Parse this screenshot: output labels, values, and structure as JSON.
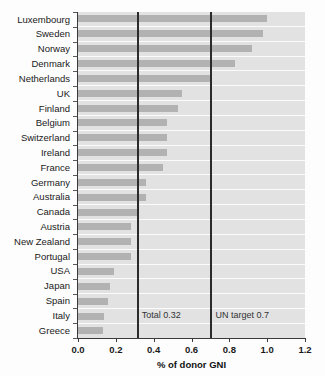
{
  "chart_data": {
    "type": "bar",
    "orientation": "horizontal",
    "title": "",
    "xlabel": "% of donor GNI",
    "ylabel": "",
    "xlim": [
      0.0,
      1.2
    ],
    "grid": false,
    "legend": "none",
    "xticks": [
      "0.0",
      "0.2",
      "0.4",
      "0.6",
      "0.8",
      "1.0",
      "1.2"
    ],
    "xtick_values": [
      0.0,
      0.2,
      0.4,
      0.6,
      0.8,
      1.0,
      1.2
    ],
    "categories": [
      "Luxembourg",
      "Sweden",
      "Norway",
      "Denmark",
      "Netherlands",
      "UK",
      "Finland",
      "Belgium",
      "Switzerland",
      "Ireland",
      "France",
      "Germany",
      "Australia",
      "Canada",
      "Austria",
      "New Zealand",
      "Portugal",
      "USA",
      "Japan",
      "Spain",
      "Italy",
      "Greece"
    ],
    "values": [
      1.0,
      0.98,
      0.92,
      0.83,
      0.7,
      0.55,
      0.53,
      0.47,
      0.47,
      0.47,
      0.45,
      0.36,
      0.36,
      0.31,
      0.28,
      0.28,
      0.28,
      0.19,
      0.17,
      0.16,
      0.14,
      0.13
    ],
    "reference_lines": [
      {
        "label": "Total 0.32",
        "value": 0.31
      },
      {
        "label": "UN target 0.7",
        "value": 0.7
      }
    ],
    "colors": {
      "bar": "#b2b2b2",
      "plot_background": "#e2e2e2",
      "row_separator": "#fbfbfb",
      "reference_line": "#2b2b2b",
      "axis": "#3a3a3a",
      "text": "#1a1a1a"
    }
  }
}
